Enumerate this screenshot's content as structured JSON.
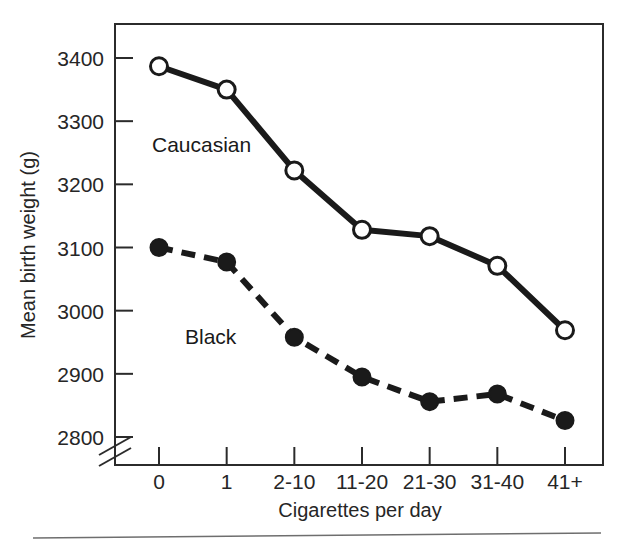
{
  "chart_data": {
    "type": "line",
    "title": "",
    "xlabel": "Cigarettes per day",
    "ylabel": "Mean birth weight (g)",
    "categories": [
      "0",
      "1",
      "2-10",
      "11-20",
      "21-30",
      "31-40",
      "41+"
    ],
    "ylim": [
      2800,
      3400
    ],
    "yticks": [
      2800,
      2900,
      3000,
      3100,
      3200,
      3300,
      3400
    ],
    "ytick_labels": [
      "2800",
      "2900",
      "3000",
      "3100",
      "3200",
      "3300",
      "3400"
    ],
    "y_axis_break": true,
    "grid": false,
    "legend": "inline-labels",
    "series": [
      {
        "name": "Caucasian",
        "marker": "open-circle",
        "line_style": "solid",
        "color": "#1a1a1a",
        "values": [
          3387,
          3350,
          3222,
          3128,
          3118,
          3071,
          2969
        ]
      },
      {
        "name": "Black",
        "marker": "filled-circle",
        "line_style": "dashed",
        "color": "#1a1a1a",
        "values": [
          3100,
          3077,
          2958,
          2895,
          2856,
          2868,
          2826
        ]
      }
    ]
  },
  "figure": {
    "caption_rule": "horizontal-rule",
    "frame": "box-border"
  },
  "labels": {
    "caucasian": "Caucasian",
    "black": "Black",
    "y_axis_title": "Mean birth weight (g)",
    "x_axis_title": "Cigarettes per day"
  }
}
